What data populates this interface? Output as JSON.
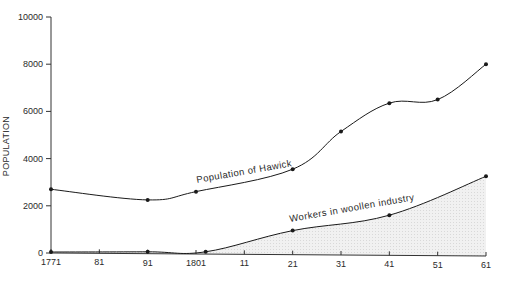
{
  "chart_data": {
    "type": "line",
    "title": "",
    "xlabel": "",
    "ylabel": "POPULATION",
    "ylim": [
      0,
      10000
    ],
    "xlim": [
      1771,
      1861
    ],
    "grid": false,
    "yticks": [
      0,
      2000,
      4000,
      6000,
      8000,
      10000
    ],
    "ytick_labels": [
      "0",
      "2000",
      "4000",
      "6000",
      "8000",
      "10000"
    ],
    "xticks": [
      1771,
      1781,
      1791,
      1801,
      1811,
      1821,
      1831,
      1841,
      1851,
      1861
    ],
    "xtick_labels": [
      "1771",
      "81",
      "91",
      "1801",
      "11",
      "21",
      "31",
      "41",
      "51",
      "61"
    ],
    "series": [
      {
        "name": "Population of Hawick",
        "style": "line-with-markers",
        "x": [
          1771,
          1791,
          1801,
          1821,
          1831,
          1841,
          1851,
          1861
        ],
        "values": [
          2700,
          2250,
          2600,
          3550,
          5150,
          6350,
          6500,
          8000
        ]
      },
      {
        "name": "Workers in woollen industry",
        "style": "line-with-markers, shaded area below",
        "x": [
          1771,
          1791,
          1803,
          1821,
          1841,
          1861
        ],
        "values": [
          0,
          50,
          50,
          950,
          1600,
          3250
        ]
      }
    ],
    "annotations": [
      {
        "text": "Population of Hawick",
        "near_x": 1811
      },
      {
        "text": "Workers in woollen industry",
        "near_x": 1831
      }
    ],
    "legend": "inline labels on lines"
  },
  "colors": {
    "line": "#1a1a1a",
    "axis": "#333333",
    "area_fill": "#ececec",
    "background": "#ffffff"
  }
}
